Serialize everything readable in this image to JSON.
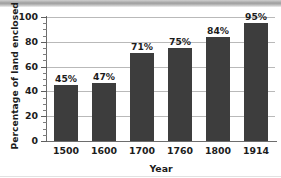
{
  "chart_data": {
    "type": "bar",
    "title": "",
    "xlabel": "Year",
    "ylabel": "Percentage of land enclosed",
    "categories": [
      "1500",
      "1600",
      "1700",
      "1760",
      "1800",
      "1914"
    ],
    "values": [
      45,
      47,
      71,
      75,
      84,
      95
    ],
    "data_labels": [
      "45%",
      "47%",
      "71%",
      "75%",
      "84%",
      "95%"
    ],
    "ylim": [
      0,
      100
    ],
    "ytick_labels": [
      "0",
      "20",
      "40",
      "60",
      "80",
      "100"
    ],
    "ytick_values": [
      0,
      20,
      40,
      60,
      80,
      100
    ],
    "minor_tick_step": 5,
    "grid": "horizontal",
    "legend": "none",
    "bar_color": "#3d3d3d",
    "grid_color": "#b9b9b9",
    "axis_color": "#6d6d6d",
    "text_color": "#1c1c1c",
    "background": "#ffffff"
  }
}
